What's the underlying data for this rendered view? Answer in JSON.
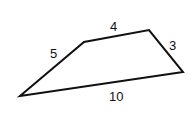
{
  "diagram": {
    "type": "quadrilateral",
    "stroke_color": "#111111",
    "vertices": [
      [
        20,
        96
      ],
      [
        84,
        42
      ],
      [
        149,
        30
      ],
      [
        183,
        72
      ]
    ],
    "sides": [
      {
        "label": "5",
        "from": 0,
        "to": 1,
        "x": 55,
        "y": 58
      },
      {
        "label": "4",
        "from": 1,
        "to": 2,
        "x": 114,
        "y": 31
      },
      {
        "label": "3",
        "from": 2,
        "to": 3,
        "x": 172,
        "y": 50
      },
      {
        "label": "10",
        "from": 3,
        "to": 0,
        "x": 117,
        "y": 101
      }
    ]
  }
}
